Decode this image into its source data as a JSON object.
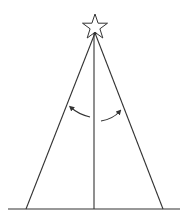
{
  "diagram": {
    "colors": {
      "background": "#ffffff",
      "stroke": "#333333"
    },
    "elements": [
      {
        "name": "star",
        "shape": "five-point-star"
      },
      {
        "name": "left-side",
        "shape": "line"
      },
      {
        "name": "right-side",
        "shape": "line"
      },
      {
        "name": "center-pole",
        "shape": "line"
      },
      {
        "name": "ground-line",
        "shape": "line"
      },
      {
        "name": "left-curved-arrow",
        "shape": "arc-arrow"
      },
      {
        "name": "right-curved-arrow",
        "shape": "arc-arrow"
      }
    ]
  }
}
